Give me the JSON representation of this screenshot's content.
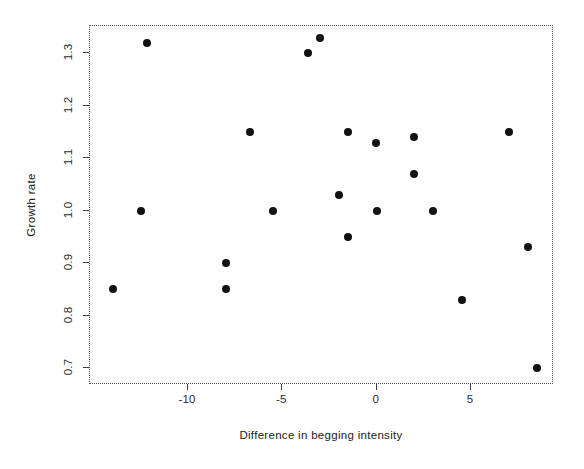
{
  "chart_data": {
    "type": "scatter",
    "title": "",
    "xlabel": "Difference in begging intensity",
    "ylabel": "Growth rate",
    "xlim": [
      -15.2,
      9.4
    ],
    "ylim": [
      0.668,
      1.352
    ],
    "xticks": [
      -10,
      -5,
      0,
      5
    ],
    "xtick_labels": [
      "-10",
      "-5",
      "0",
      "5"
    ],
    "yticks": [
      0.7,
      0.8,
      0.9,
      1.0,
      1.1,
      1.2,
      1.3
    ],
    "ytick_labels": [
      "0.7",
      "0.8",
      "0.9",
      "1.0",
      "1.1",
      "1.2",
      "1.3"
    ],
    "grid": false,
    "legend": null,
    "marker": "filled-circle",
    "marker_color": "#121212",
    "frame_color": "#4a4a4a",
    "background": "#ffffff",
    "n_points": 21,
    "x": [
      -14.0,
      -12.5,
      -12.2,
      -8.0,
      -8.0,
      -6.7,
      -5.5,
      -3.65,
      -3.0,
      -2.0,
      -1.5,
      -1.5,
      -0.05,
      0.0,
      2.0,
      2.0,
      3.0,
      4.5,
      7.0,
      8.0,
      8.5
    ],
    "y": [
      0.85,
      1.0,
      1.32,
      0.9,
      0.85,
      1.15,
      1.0,
      1.3,
      1.33,
      1.03,
      1.15,
      0.95,
      1.13,
      1.0,
      1.14,
      1.07,
      1.0,
      0.83,
      1.15,
      0.93,
      0.7
    ],
    "points": [
      {
        "x": -14.0,
        "y": 0.85
      },
      {
        "x": -12.5,
        "y": 1.0
      },
      {
        "x": -12.2,
        "y": 1.32
      },
      {
        "x": -8.0,
        "y": 0.9
      },
      {
        "x": -8.0,
        "y": 0.85
      },
      {
        "x": -6.7,
        "y": 1.15
      },
      {
        "x": -5.5,
        "y": 1.0
      },
      {
        "x": -3.65,
        "y": 1.3
      },
      {
        "x": -3.0,
        "y": 1.33
      },
      {
        "x": -2.0,
        "y": 1.03
      },
      {
        "x": -1.5,
        "y": 1.15
      },
      {
        "x": -1.5,
        "y": 0.95
      },
      {
        "x": -0.05,
        "y": 1.13
      },
      {
        "x": 0.0,
        "y": 1.0
      },
      {
        "x": 2.0,
        "y": 1.14
      },
      {
        "x": 2.0,
        "y": 1.07
      },
      {
        "x": 3.0,
        "y": 1.0
      },
      {
        "x": 4.5,
        "y": 0.83
      },
      {
        "x": 7.0,
        "y": 1.15
      },
      {
        "x": 8.0,
        "y": 0.93
      },
      {
        "x": 8.5,
        "y": 0.7
      }
    ]
  }
}
